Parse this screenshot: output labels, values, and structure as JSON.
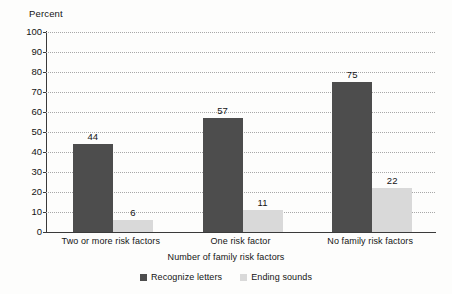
{
  "chart_data": {
    "type": "bar",
    "title": "",
    "subtitle": "",
    "ylabel": "Percent",
    "xlabel": "Number of family risk factors",
    "ylim": [
      0,
      100
    ],
    "ytick_step": 10,
    "yticks": [
      "100",
      "90",
      "80",
      "70",
      "60",
      "50",
      "40",
      "30",
      "20",
      "10",
      "0"
    ],
    "grid": true,
    "legend_position": "bottom-center",
    "categories": [
      "Two or more risk factors",
      "One risk factor",
      "No family risk factors"
    ],
    "series": [
      {
        "name": "Recognize letters",
        "color": "#4d4d4d",
        "values": [
          44,
          57,
          75
        ],
        "labels": [
          "44",
          "57",
          "75"
        ]
      },
      {
        "name": "Ending sounds",
        "color": "#d9d9d9",
        "values": [
          6,
          11,
          22
        ],
        "labels": [
          "6",
          "11",
          "22"
        ]
      }
    ]
  },
  "legend": {
    "items": [
      {
        "label": "Recognize letters",
        "color": "#4d4d4d"
      },
      {
        "label": "Ending sounds",
        "color": "#d9d9d9"
      }
    ]
  }
}
